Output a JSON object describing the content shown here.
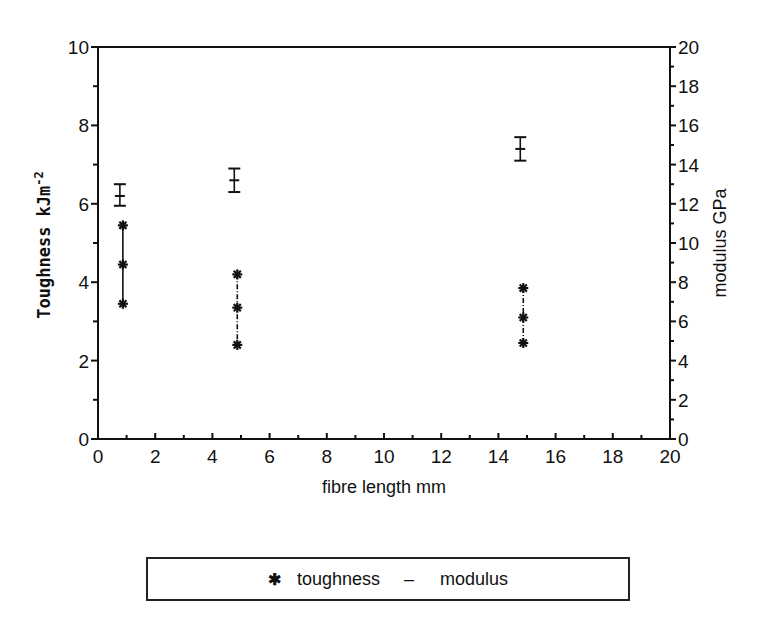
{
  "chart_data": {
    "type": "scatter",
    "title": "",
    "xlabel": "fibre length mm",
    "ylabel": "Toughness kJm-2",
    "ylabel_right": "modulus GPa",
    "xlim": [
      0,
      20
    ],
    "ylim": [
      0,
      10
    ],
    "ylim_right": [
      0,
      20
    ],
    "x_ticks": [
      0,
      2,
      4,
      6,
      8,
      10,
      12,
      14,
      16,
      18,
      20
    ],
    "y_ticks": [
      0,
      2,
      4,
      6,
      8,
      10
    ],
    "y_ticks_right": [
      0,
      2,
      4,
      6,
      8,
      10,
      12,
      14,
      16,
      18,
      20
    ],
    "grid": false,
    "legend_position": "bottom",
    "series": [
      {
        "name": "toughness",
        "axis": "left",
        "marker": "asterisk",
        "points": [
          {
            "x": 0.8,
            "mean": 4.45,
            "high": 5.45,
            "low": 3.45
          },
          {
            "x": 4.8,
            "mean": 3.35,
            "high": 4.2,
            "low": 2.4
          },
          {
            "x": 14.8,
            "mean": 3.1,
            "high": 3.85,
            "low": 2.45
          }
        ]
      },
      {
        "name": "modulus",
        "axis": "right",
        "marker": "dash-errorbar",
        "points": [
          {
            "x": 0.8,
            "mean": 12.4,
            "high": 13.0,
            "low": 11.9
          },
          {
            "x": 4.8,
            "mean": 13.2,
            "high": 13.8,
            "low": 12.6
          },
          {
            "x": 14.8,
            "mean": 14.8,
            "high": 15.4,
            "low": 14.2
          }
        ]
      }
    ]
  },
  "legend": {
    "toughness_symbol": "✱",
    "toughness_label": "toughness",
    "modulus_symbol": "–",
    "modulus_label": "modulus"
  }
}
